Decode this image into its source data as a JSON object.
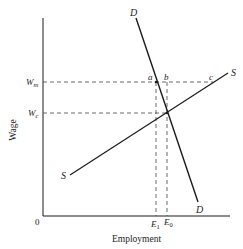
{
  "diagram": {
    "type": "labor-market-minimum-wage",
    "xlabel": "Employment",
    "ylabel": "Wage",
    "origin_label": "0",
    "y_ticks": [
      {
        "label": "W",
        "sub": "m",
        "y": 82
      },
      {
        "label": "W",
        "sub": "c",
        "y": 113
      }
    ],
    "x_ticks": [
      {
        "label": "E",
        "sub": "1",
        "x": 156
      },
      {
        "label": "E",
        "sub": "0",
        "x": 167
      }
    ],
    "curves": [
      {
        "name": "D",
        "label_start": "D",
        "label_end": "D",
        "from": [
          136,
          18
        ],
        "to": [
          198,
          202
        ]
      },
      {
        "name": "S",
        "label_start": "S",
        "label_end": "S",
        "from": [
          70,
          175
        ],
        "to": [
          228,
          73
        ]
      }
    ],
    "points": [
      {
        "label": "a",
        "x": 156,
        "y": 82
      },
      {
        "label": "b",
        "x": 167,
        "y": 82
      },
      {
        "label": "c",
        "x": 213,
        "y": 82
      }
    ],
    "colors": {
      "line": "#1a1a1a",
      "dash": "#444444",
      "text": "#222222"
    }
  }
}
